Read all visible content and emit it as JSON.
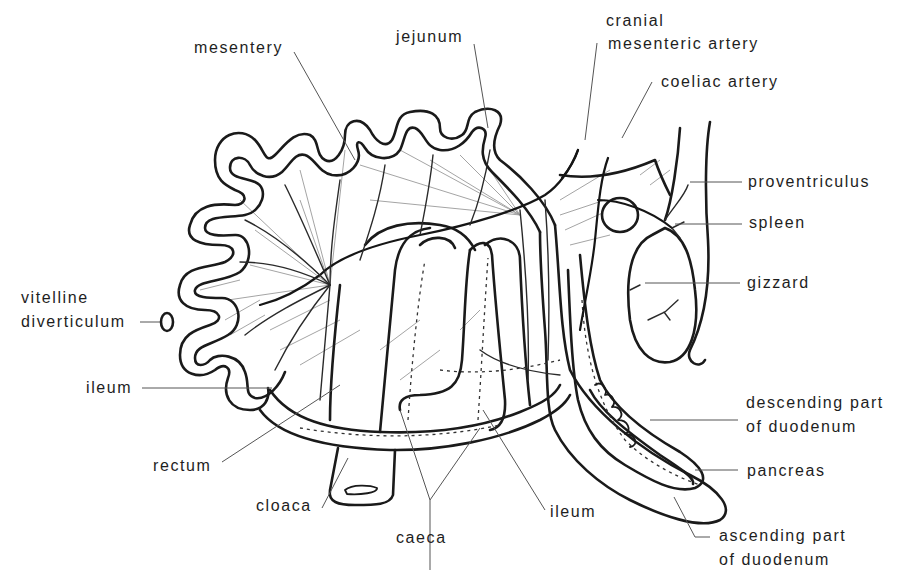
{
  "figure": {
    "labels": {
      "mesentery": "mesentery",
      "jejunum": "jejunum",
      "cranial_mesenteric_artery_1": "cranial",
      "cranial_mesenteric_artery_2": "mesenteric artery",
      "coeliac_artery": "coeliac artery",
      "proventriculus": "proventriculus",
      "spleen": "spleen",
      "gizzard": "gizzard",
      "vitelline_diverticulum_1": "vitelline",
      "vitelline_diverticulum_2": "diverticulum",
      "ileum_left": "ileum",
      "descending_duodenum_1": "descending part",
      "descending_duodenum_2": "of duodenum",
      "pancreas": "pancreas",
      "rectum": "rectum",
      "cloaca": "cloaca",
      "caeca": "caeca",
      "ileum_bottom": "ileum",
      "ascending_duodenum_1": "ascending part",
      "ascending_duodenum_2": "of duodenum"
    },
    "colors": {
      "line": "#1a1a1a",
      "text": "#1e1e1e",
      "background": "#ffffff"
    }
  }
}
